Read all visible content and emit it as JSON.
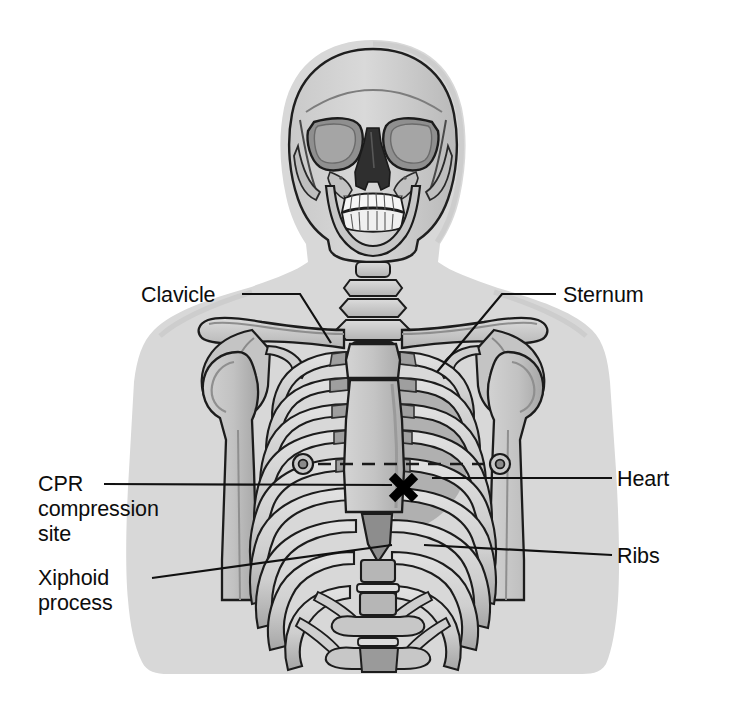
{
  "figure": {
    "background_color": "#ffffff"
  },
  "labels": [
    {
      "id": "clavicle",
      "text": "Clavicle",
      "lines": [
        "Clavicle"
      ],
      "side": "left",
      "anchor_x": 242,
      "anchor_y": 294,
      "target_x": 330,
      "target_y": 343
    },
    {
      "id": "sternum",
      "text": "Sternum",
      "lines": [
        "Sternum"
      ],
      "side": "right",
      "anchor_x": 556,
      "anchor_y": 294,
      "target_x": 437,
      "target_y": 372
    },
    {
      "id": "cpr-compression-site",
      "text": "CPR compression site",
      "lines": [
        "CPR",
        "compression",
        "site"
      ],
      "side": "left",
      "anchor_x": 104,
      "anchor_y": 484,
      "target_x": 392,
      "target_y": 485
    },
    {
      "id": "xiphoid-process",
      "text": "Xiphoid process",
      "lines": [
        "Xiphoid",
        "process"
      ],
      "side": "left",
      "anchor_x": 152,
      "anchor_y": 578,
      "target_x": 392,
      "target_y": 545
    },
    {
      "id": "heart",
      "text": "Heart",
      "lines": [
        "Heart"
      ],
      "side": "right",
      "anchor_x": 612,
      "anchor_y": 478,
      "target_x": 432,
      "target_y": 478
    },
    {
      "id": "ribs",
      "text": "Ribs",
      "lines": [
        "Ribs"
      ],
      "side": "right",
      "anchor_x": 612,
      "anchor_y": 555,
      "target_x": 424,
      "target_y": 545
    }
  ],
  "markers": {
    "compression_x": {
      "name": "x-mark",
      "glyph": "✕",
      "x": 403,
      "y": 487,
      "color": "#000000"
    },
    "nipple_line": {
      "name": "nipple-line",
      "style": "dashed",
      "y": 464,
      "x_start": 296,
      "x_end": 508
    },
    "nipples": [
      {
        "x": 303,
        "y": 464
      },
      {
        "x": 500,
        "y": 464
      }
    ]
  },
  "colors": {
    "body_silhouette": "#d6d6d6",
    "body_silhouette_edge": "#c6c6c6",
    "bone_light": "#d9d9d9",
    "bone_mid": "#bdbdbd",
    "bone_shadow": "#9d9d9d",
    "bone_dark": "#8a8a8a",
    "cavity_dark": "#3b3b3b",
    "teeth": "#f4f4f4",
    "outline": "#1a1a1a",
    "leader_line": "#111111",
    "heart_shade": "#a8a8a8",
    "text": "#0d0d0d"
  },
  "anatomy_parts": [
    "cranium",
    "orbits",
    "nasal-cavity",
    "maxilla",
    "mandible",
    "teeth",
    "cervical-vertebrae",
    "clavicle-left",
    "clavicle-right",
    "scapula-left",
    "scapula-right",
    "humerus-left",
    "humerus-right",
    "sternum",
    "xiphoid-process",
    "ribs",
    "costal-cartilage",
    "lumbar-vertebrae",
    "heart-outline"
  ]
}
